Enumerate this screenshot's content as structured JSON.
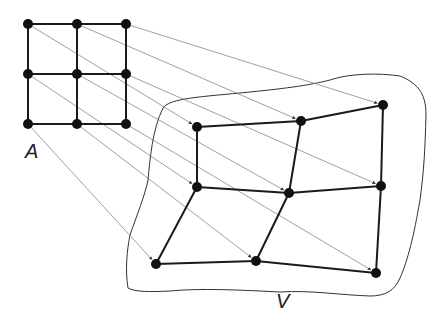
{
  "labels": {
    "source": "A",
    "target": "V"
  },
  "source_grid": {
    "nodes": [
      [
        28,
        24
      ],
      [
        77,
        24
      ],
      [
        126,
        24
      ],
      [
        28,
        74
      ],
      [
        77,
        74
      ],
      [
        126,
        74
      ],
      [
        28,
        124
      ],
      [
        77,
        124
      ],
      [
        126,
        124
      ]
    ]
  },
  "target_grid": {
    "nodes": [
      [
        197,
        127
      ],
      [
        301,
        121
      ],
      [
        383,
        105
      ],
      [
        197,
        187
      ],
      [
        289,
        193
      ],
      [
        381,
        186
      ],
      [
        156,
        264
      ],
      [
        256,
        261
      ],
      [
        376,
        273
      ]
    ]
  },
  "colors": {
    "edge": "#1a1a1a",
    "node": "#111111",
    "arrow": "#777777",
    "outline": "#333333"
  }
}
